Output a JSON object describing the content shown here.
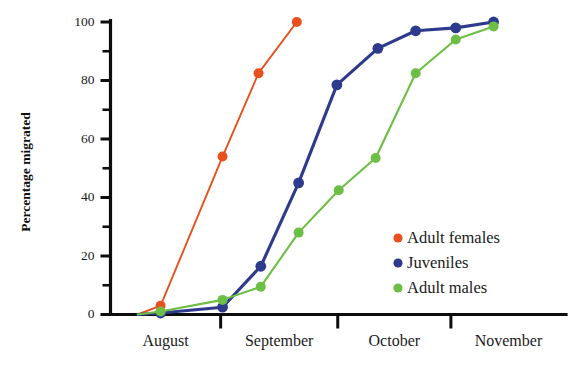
{
  "chart_data": {
    "type": "line",
    "title": "",
    "xlabel": "",
    "ylabel": "Percentage migrated",
    "ylim": [
      0,
      100
    ],
    "y_ticks_major": [
      0,
      20,
      40,
      60,
      80,
      100
    ],
    "y_ticks_minor": [
      10,
      30,
      50,
      70,
      90
    ],
    "y_tick_labels": [
      "0",
      "20",
      "40",
      "60",
      "80",
      "100"
    ],
    "x_category_labels": [
      "August",
      "September",
      "October",
      "November"
    ],
    "x_axis_range_months": [
      "August",
      "November"
    ],
    "grid": false,
    "legend_position": "bottom-right",
    "series": [
      {
        "name": "Adult females",
        "color": "#E8501E",
        "x": [
          0.06,
          0.11,
          0.246,
          0.325,
          0.409
        ],
        "values": [
          0,
          3,
          54,
          82.5,
          100
        ]
      },
      {
        "name": "Juveniles",
        "color": "#2E3B8C",
        "x": [
          0.06,
          0.11,
          0.246,
          0.33,
          0.413,
          0.497,
          0.587,
          0.67,
          0.758,
          0.841
        ],
        "values": [
          0,
          0.5,
          2.5,
          16.5,
          45,
          78.5,
          91,
          97,
          98,
          100
        ]
      },
      {
        "name": "Adult males",
        "color": "#6CBE45",
        "x": [
          0.06,
          0.11,
          0.246,
          0.33,
          0.413,
          0.501,
          0.582,
          0.67,
          0.758,
          0.841
        ],
        "values": [
          0,
          1,
          5,
          9.5,
          28,
          42.5,
          53.5,
          82.5,
          94,
          98.5
        ]
      }
    ]
  },
  "legend": {
    "entries": [
      {
        "label": "Adult females",
        "color": "#E8501E"
      },
      {
        "label": "Juveniles",
        "color": "#2E3B8C"
      },
      {
        "label": "Adult males",
        "color": "#6CBE45"
      }
    ]
  },
  "axes": {
    "y_title": "Percentage migrated"
  }
}
